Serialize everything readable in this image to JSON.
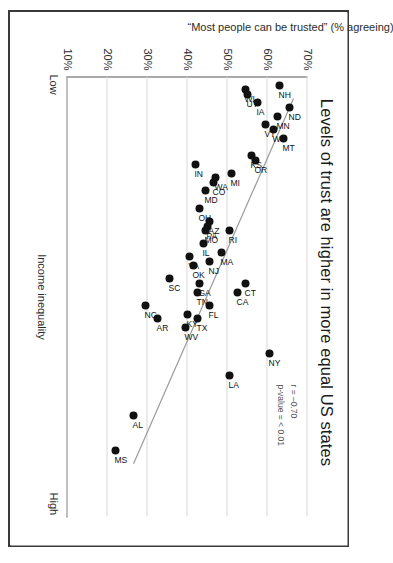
{
  "figure": {
    "title": "Levels of trust are higher in more equal US states",
    "x_axis": {
      "title": "Income inequality",
      "low_label": "Low",
      "high_label": "High"
    },
    "y_axis": {
      "title": "“Most people can be trusted” (% agreeing)",
      "ticks": [
        "70%",
        "60%",
        "50%",
        "40%",
        "30%",
        "20%",
        "10%"
      ]
    },
    "stats": {
      "correlation": "r = –0.70",
      "pvalue": "p-value = < 0.01"
    },
    "colors": {
      "point": "#111111",
      "trendline": "#9a9a9a",
      "gridline": "#d8d8d8",
      "axis": "#555555",
      "frame": "#3a3a3a",
      "text": "#1a1a1a"
    }
  },
  "chart_data": {
    "type": "scatter",
    "title": "Levels of trust are higher in more equal US states",
    "xlabel": "Income inequality",
    "ylabel": "“Most people can be trusted” (% agreeing)",
    "xlim": [
      0,
      100
    ],
    "ylim": [
      10,
      70
    ],
    "yticks": [
      70,
      60,
      50,
      40,
      30,
      20,
      10
    ],
    "xticks_text": [
      "Low",
      "High"
    ],
    "grid": true,
    "legend": null,
    "annotations": [
      "r = –0.70",
      "p-value = < 0.01"
    ],
    "trendline": {
      "type": "linear",
      "direction": "negative",
      "x_start": 5,
      "y_start": 66.5,
      "x_end": 88,
      "y_end": 26.5
    },
    "points": [
      {
        "label": "ND",
        "x": 7,
        "y": 65.5
      },
      {
        "label": "NH",
        "x": 2,
        "y": 63.0
      },
      {
        "label": "MT",
        "x": 14,
        "y": 64.0
      },
      {
        "label": "MN",
        "x": 9,
        "y": 62.5
      },
      {
        "label": "WY",
        "x": 12,
        "y": 61.5
      },
      {
        "label": "VT",
        "x": 11,
        "y": 59.5
      },
      {
        "label": "UT",
        "x": 4,
        "y": 55.0
      },
      {
        "label": "IA",
        "x": 6,
        "y": 57.5
      },
      {
        "label": "WI",
        "x": 3,
        "y": 54.5
      },
      {
        "label": "KS",
        "x": 18,
        "y": 56.0
      },
      {
        "label": "OR",
        "x": 19,
        "y": 57.0
      },
      {
        "label": "MI",
        "x": 22,
        "y": 51.0
      },
      {
        "label": "WA",
        "x": 23,
        "y": 47.0
      },
      {
        "label": "CO",
        "x": 24,
        "y": 46.5
      },
      {
        "label": "MD",
        "x": 26,
        "y": 44.5
      },
      {
        "label": "IN",
        "x": 20,
        "y": 42.0
      },
      {
        "label": "OH",
        "x": 30,
        "y": 43.0
      },
      {
        "label": "RI",
        "x": 35,
        "y": 50.5
      },
      {
        "label": "AZ",
        "x": 33,
        "y": 45.5
      },
      {
        "label": "PA",
        "x": 34,
        "y": 45.0
      },
      {
        "label": "MO",
        "x": 35,
        "y": 44.5
      },
      {
        "label": "IL",
        "x": 38,
        "y": 44.0
      },
      {
        "label": "MA",
        "x": 40,
        "y": 48.5
      },
      {
        "label": "CT",
        "x": 47,
        "y": 54.5
      },
      {
        "label": "CA",
        "x": 49,
        "y": 52.5
      },
      {
        "label": "NJ",
        "x": 42,
        "y": 45.5
      },
      {
        "label": "OK",
        "x": 43,
        "y": 41.5
      },
      {
        "label": "VA",
        "x": 41,
        "y": 40.5
      },
      {
        "label": "GA",
        "x": 47,
        "y": 43.0
      },
      {
        "label": "TN",
        "x": 49,
        "y": 42.5
      },
      {
        "label": "FL",
        "x": 52,
        "y": 45.5
      },
      {
        "label": "TX",
        "x": 55,
        "y": 42.5
      },
      {
        "label": "KY",
        "x": 54,
        "y": 40.0
      },
      {
        "label": "WV",
        "x": 57,
        "y": 39.5
      },
      {
        "label": "SC",
        "x": 46,
        "y": 35.5
      },
      {
        "label": "AR",
        "x": 55,
        "y": 32.5
      },
      {
        "label": "NC",
        "x": 52,
        "y": 29.5
      },
      {
        "label": "NY",
        "x": 63,
        "y": 60.5
      },
      {
        "label": "LA",
        "x": 68,
        "y": 50.5
      },
      {
        "label": "AL",
        "x": 77,
        "y": 26.5
      },
      {
        "label": "MS",
        "x": 85,
        "y": 22.0
      }
    ]
  }
}
